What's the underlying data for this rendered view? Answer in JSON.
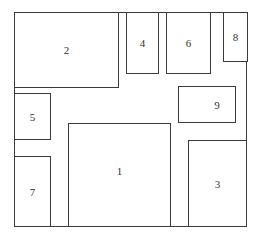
{
  "diagram": {
    "type": "floor-plan-layout",
    "boundary": {
      "left": 14,
      "top": 12,
      "right": 247,
      "bottom": 226
    },
    "line_color": "#3a3a3a",
    "boxes": [
      {
        "id": "1",
        "label": "1",
        "x": 68,
        "y": 123,
        "w": 102,
        "h": 103,
        "label_dx": 0,
        "label_dy": -4
      },
      {
        "id": "2",
        "label": "2",
        "x": 14,
        "y": 12,
        "w": 104,
        "h": 75,
        "label_dx": 0,
        "label_dy": 0
      },
      {
        "id": "3",
        "label": "3",
        "x": 188,
        "y": 140,
        "w": 58,
        "h": 86,
        "label_dx": 0,
        "label_dy": 0
      },
      {
        "id": "4",
        "label": "4",
        "x": 126,
        "y": 12,
        "w": 32,
        "h": 61,
        "label_dx": 0,
        "label_dy": 0
      },
      {
        "id": "5",
        "label": "5",
        "x": 14,
        "y": 93,
        "w": 36,
        "h": 46,
        "label_dx": 0,
        "label_dy": 0
      },
      {
        "id": "6",
        "label": "6",
        "x": 166,
        "y": 12,
        "w": 44,
        "h": 61,
        "label_dx": 0,
        "label_dy": 0
      },
      {
        "id": "7",
        "label": "7",
        "x": 14,
        "y": 156,
        "w": 36,
        "h": 70,
        "label_dx": 0,
        "label_dy": 0
      },
      {
        "id": "8",
        "label": "8",
        "x": 223,
        "y": 12,
        "w": 24,
        "h": 49,
        "label_dx": 0,
        "label_dy": 0
      },
      {
        "id": "9",
        "label": "9",
        "x": 178,
        "y": 86,
        "w": 57,
        "h": 36,
        "label_dx": 10,
        "label_dy": 0
      }
    ]
  }
}
